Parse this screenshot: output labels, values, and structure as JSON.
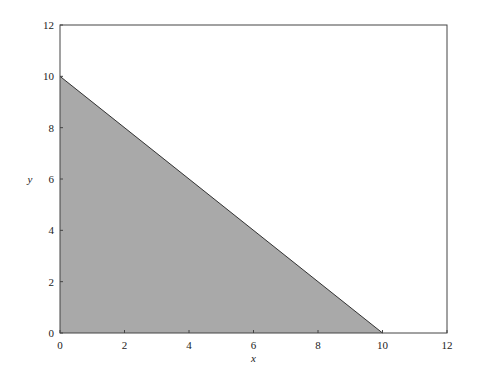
{
  "chart_data": {
    "type": "area",
    "title": "",
    "xlabel": "x",
    "ylabel": "y",
    "xlim": [
      0,
      12
    ],
    "ylim": [
      0,
      12
    ],
    "x_ticks": [
      0,
      2,
      4,
      6,
      8,
      10,
      12
    ],
    "y_ticks": [
      0,
      2,
      4,
      6,
      8,
      10,
      12
    ],
    "x_tick_labels": [
      "0",
      "2",
      "4",
      "6",
      "8",
      "10",
      "12"
    ],
    "y_tick_labels": [
      "0",
      "2",
      "4",
      "6",
      "8",
      "10",
      "12"
    ],
    "grid": false,
    "legend": null,
    "series": [
      {
        "name": "shaded region x + y <= 10",
        "polygon": [
          [
            0,
            0
          ],
          [
            0,
            10
          ],
          [
            10,
            0
          ]
        ],
        "boundary_line": {
          "x": [
            0,
            10
          ],
          "y": [
            10,
            0
          ]
        },
        "fill_color": "#a9a9a9",
        "edge_color": "#333333"
      }
    ]
  },
  "colors": {
    "fill": "#a9a9a9",
    "axis": "#444444",
    "background": "#ffffff"
  }
}
